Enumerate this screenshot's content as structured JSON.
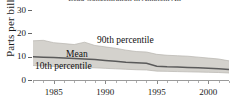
{
  "chart_data": {
    "type": "area",
    "title": "Lead Concentration in Ambient Air",
    "ylabel": "Parts per billion",
    "xlabel": "",
    "ylim": [
      0,
      30
    ],
    "xlim": [
      1983,
      2002
    ],
    "yticks": [
      0,
      10,
      20,
      30
    ],
    "ytick_labels": [
      "0",
      "10",
      "20",
      "30"
    ],
    "xticks": [
      1985,
      1990,
      1995,
      2000
    ],
    "xtick_labels": [
      "1985",
      "1990",
      "1995",
      "2000"
    ],
    "grid": false,
    "legend_position": "inline-annotations",
    "band_fill": "#d4d2cd",
    "line_color": "#5a5a5a",
    "x": [
      1983,
      1984,
      1985,
      1986,
      1987,
      1988,
      1989,
      1990,
      1991,
      1992,
      1993,
      1994,
      1995,
      1996,
      1997,
      1998,
      1999,
      2000,
      2001,
      2002
    ],
    "series": [
      {
        "name": "90th percentile",
        "values": [
          16.8,
          17.0,
          16.0,
          15.6,
          15.2,
          16.2,
          14.8,
          14.2,
          13.6,
          12.8,
          12.2,
          12.0,
          11.0,
          10.6,
          10.4,
          10.2,
          9.8,
          9.4,
          9.0,
          8.2
        ]
      },
      {
        "name": "Mean",
        "values": [
          10.0,
          9.8,
          9.6,
          9.4,
          9.2,
          9.0,
          8.8,
          8.4,
          8.0,
          7.6,
          7.4,
          7.2,
          5.9,
          5.7,
          5.6,
          5.4,
          5.2,
          5.0,
          4.8,
          4.5
        ]
      },
      {
        "name": "10th percentile",
        "values": [
          6.2,
          6.0,
          5.8,
          5.6,
          5.5,
          5.4,
          5.2,
          5.0,
          4.8,
          4.6,
          4.4,
          4.3,
          3.8,
          3.7,
          3.6,
          3.5,
          3.4,
          3.3,
          3.2,
          3.0
        ]
      }
    ],
    "annotations": [
      {
        "text": "90th percentile"
      },
      {
        "text": "Mean"
      },
      {
        "text": "10th percentile"
      }
    ]
  }
}
